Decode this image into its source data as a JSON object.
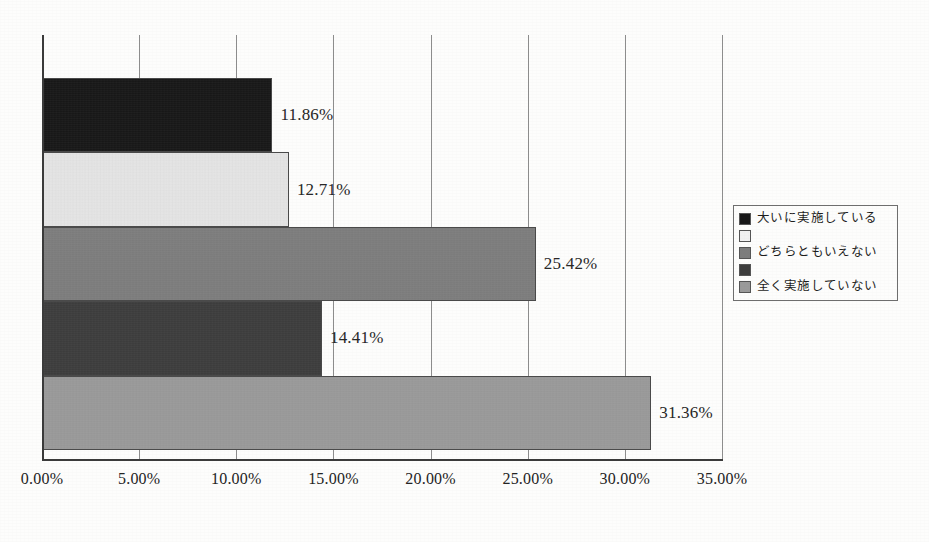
{
  "chart_data": {
    "type": "bar",
    "orientation": "horizontal",
    "title": "",
    "subtitle": "",
    "xlabel": "",
    "ylabel": "",
    "xlim": [
      0,
      35
    ],
    "grid": true,
    "grid_axis": "x",
    "legend_position": "right",
    "categories": [
      "大いに実施している",
      "",
      "どちらともいえない",
      "",
      "全く実施していない"
    ],
    "values": [
      11.86,
      12.71,
      25.42,
      14.41,
      31.36
    ],
    "data_labels": [
      "11.86%",
      "12.71%",
      "25.42%",
      "14.41%",
      "31.36%"
    ],
    "tick_values": [
      0,
      5,
      10,
      15,
      20,
      25,
      30,
      35
    ],
    "tick_labels": [
      "0.00%",
      "5.00%",
      "10.00%",
      "15.00%",
      "20.00%",
      "25.00%",
      "30.00%",
      "35.00%"
    ],
    "series_colors": [
      "#161616",
      "#e6e6e6",
      "#7d7d7d",
      "#3c3c3c",
      "#9a9a9a"
    ],
    "legend_entries": [
      {
        "label": "大いに実施している",
        "color": "#161616"
      },
      {
        "label": "",
        "color": "#f2f2f2"
      },
      {
        "label": "どちらともいえない",
        "color": "#7d7d7d"
      },
      {
        "label": "",
        "color": "#3c3c3c"
      },
      {
        "label": "全く実施していない",
        "color": "#9a9a9a"
      }
    ]
  },
  "colors": {
    "axis": "#3a3a3a",
    "gridline": "#8d8d8d",
    "text": "#232323",
    "background": "#fdfdfc",
    "legend_border": "#6e6e6e"
  }
}
